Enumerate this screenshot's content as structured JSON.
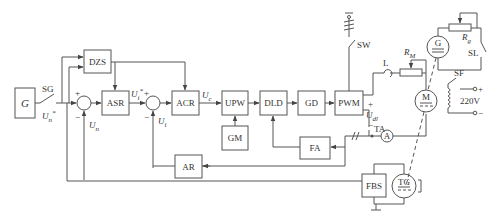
{
  "diagram": {
    "type": "control-system-block-diagram",
    "blocks": [
      {
        "id": "G",
        "label": "G"
      },
      {
        "id": "DZS",
        "label": "DZS"
      },
      {
        "id": "ASR",
        "label": "ASR"
      },
      {
        "id": "ACR",
        "label": "ACR"
      },
      {
        "id": "UPW",
        "label": "UPW"
      },
      {
        "id": "GM",
        "label": "GM"
      },
      {
        "id": "DLD",
        "label": "DLD"
      },
      {
        "id": "GD",
        "label": "GD"
      },
      {
        "id": "PWM",
        "label": "PWM"
      },
      {
        "id": "FA",
        "label": "FA"
      },
      {
        "id": "AR",
        "label": "AR"
      },
      {
        "id": "FBS",
        "label": "FBS"
      }
    ],
    "components": {
      "motor": "M",
      "generator": "G",
      "tacho": "TG",
      "ammeter": "A",
      "current_transformer": "TA",
      "inductor": "L",
      "motor_resistor": "R",
      "motor_resistor_sub": "M",
      "gen_resistor": "R",
      "gen_resistor_sub": "g",
      "switch_sg": "SG",
      "switch_sw": "SW",
      "switch_sf": "SF",
      "switch_sl": "SL",
      "supply": "220V",
      "plus": "+",
      "minus": "−",
      "plus_circle": "o+",
      "minus_circle": "o−"
    },
    "signals": {
      "un_star": "U",
      "un_star_sub": "n",
      "un_star_sup": "*",
      "un": "U",
      "un_sub": "n",
      "ui_star": "U",
      "ui_star_sub": "i",
      "ui_star_sup": "*",
      "ui": "U",
      "ui_sub": "i",
      "uc": "U",
      "uc_sub": "c",
      "ud": "U",
      "ud_sub": "dl"
    },
    "signs": {
      "plus": "+",
      "minus": "−"
    }
  }
}
